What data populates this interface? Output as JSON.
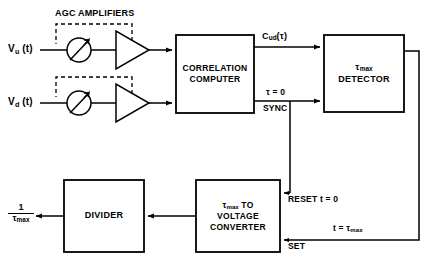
{
  "diagram": {
    "width": 432,
    "height": 269,
    "stroke_color": "#000000",
    "background_color": "#ffffff"
  },
  "headings": {
    "agc_amplifiers": "AGC AMPLIFIERS"
  },
  "inputs": [
    {
      "id": "v_u",
      "base": "V",
      "sub": "u",
      "suffix": " (t)",
      "text": "V_u (t)"
    },
    {
      "id": "v_d",
      "base": "V",
      "sub": "d",
      "suffix": " (t)",
      "text": "V_d (t)"
    }
  ],
  "blocks": [
    {
      "id": "correlation-computer",
      "lines": [
        "CORRELATION",
        "COMPUTER"
      ],
      "x": 176,
      "y": 35,
      "w": 78,
      "h": 78
    },
    {
      "id": "tmax-detector",
      "lines": [
        "τmax",
        "DETECTOR"
      ],
      "line1_base": "τ",
      "line1_sub": "max",
      "x": 324,
      "y": 35,
      "w": 80,
      "h": 77
    },
    {
      "id": "tmax-to-voltage-converter",
      "lines": [
        "τmax TO",
        "VOLTAGE",
        "CONVERTER"
      ],
      "line1_base": "τ",
      "line1_sub": "max",
      "line1_suffix": " TO",
      "x": 196,
      "y": 180,
      "w": 84,
      "h": 72
    },
    {
      "id": "divider",
      "lines": [
        "DIVIDER"
      ],
      "x": 64,
      "y": 180,
      "w": 80,
      "h": 72
    }
  ],
  "signal_labels": [
    {
      "id": "cud-tau",
      "base": "C",
      "sub": "ud",
      "suffix": "(τ)",
      "text": "C_ud(τ)"
    },
    {
      "id": "tau-zero",
      "text": "τ = 0"
    },
    {
      "id": "sync",
      "text": "SYNC"
    },
    {
      "id": "reset-t-zero",
      "text": "RESET t = 0"
    },
    {
      "id": "set",
      "text": "SET"
    },
    {
      "id": "t-equals-tmax",
      "base": "t = τ",
      "sub": "max",
      "text": "t = τmax"
    }
  ],
  "output": {
    "id": "one-over-tmax",
    "numerator": "1",
    "denominator_base": "τ",
    "denominator_sub": "max",
    "text": "1 / τmax"
  },
  "symbols": {
    "variable_gain_1": "variable-gain-circle",
    "variable_gain_2": "variable-gain-circle",
    "amplifier_1": "amplifier-triangle",
    "amplifier_2": "amplifier-triangle"
  }
}
